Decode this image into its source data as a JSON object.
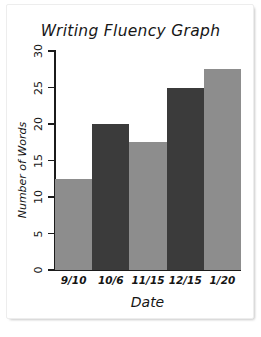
{
  "card": {
    "background": "#ffffff",
    "shadow_color": "#c9c9c9"
  },
  "chart_data": {
    "type": "bar",
    "title": "Writing Fluency Graph",
    "xlabel": "Date",
    "ylabel": "Number of Words",
    "categories": [
      "9/10",
      "10/6",
      "11/15",
      "12/15",
      "1/20"
    ],
    "values": [
      12.5,
      20,
      17.5,
      25,
      27.5
    ],
    "bar_colors": [
      "#8d8d8d",
      "#3b3b3b",
      "#8d8d8d",
      "#3b3b3b",
      "#8d8d8d"
    ],
    "ylim": [
      0,
      30
    ],
    "yticks": [
      0,
      5,
      10,
      15,
      20,
      25,
      30
    ],
    "ytick_labels": [
      "0",
      "5",
      "10",
      "15",
      "20",
      "25",
      "30"
    ],
    "grid": false,
    "legend": null,
    "axis_color": "#1b1b1b"
  }
}
